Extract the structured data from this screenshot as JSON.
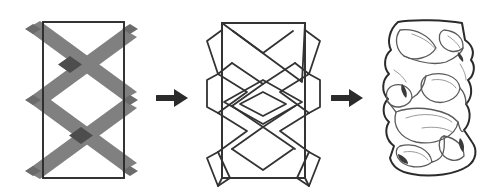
{
  "figure": {
    "background_color": "#ffffff",
    "stage_count": 3,
    "arrow_count": 2
  },
  "colors": {
    "band": "#808080",
    "band_overlap": "#4d4d4d",
    "band_partial": "#6b6b6b",
    "frame_stroke": "#2b2b2b",
    "outline_stroke": "#333333",
    "organic_stroke": "#2b2b2b",
    "organic_interior": "#5a5a5a",
    "organic_faint": "#9a9a9a",
    "arrow": "#2b2b2b",
    "background": "#ffffff"
  },
  "stages": [
    {
      "index": 1,
      "name": "banded-rectangle",
      "label": "Rectangle with crossing gray bands",
      "shape": "rectangle",
      "fill_style": "gray diagonal bands, overlaps darker",
      "rect": {
        "x": 43,
        "y": 22,
        "width": 81,
        "height": 156
      },
      "band_width": 18,
      "crossings": 2,
      "bands_extend_beyond_frame": true
    },
    {
      "index": 2,
      "name": "outlined-pattern",
      "label": "Line-outline version with central diamond",
      "shape": "rectangle",
      "fill_style": "outline only",
      "rect": {
        "x": 37,
        "y": 23,
        "width": 83,
        "height": 155
      },
      "has_central_diamond": true,
      "crossings": 2
    },
    {
      "index": 3,
      "name": "organic-form",
      "label": "Organic distorted hand-drawn form",
      "shape": "irregular-blob",
      "fill_style": "white with sketch lines",
      "hand_drawn": true
    }
  ],
  "arrows": [
    {
      "index": 1,
      "name": "arrow-stage1-to-stage2",
      "direction": "right",
      "glyph": "→"
    },
    {
      "index": 2,
      "name": "arrow-stage2-to-stage3",
      "direction": "right",
      "glyph": "→"
    }
  ]
}
